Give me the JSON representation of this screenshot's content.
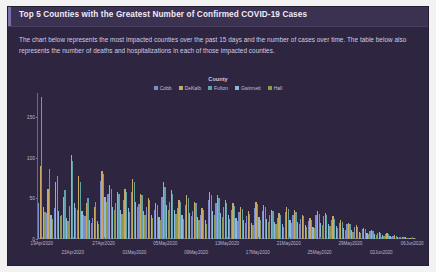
{
  "card": {
    "title": "Top 5 Counties with the Greatest Number of Confirmed COVID-19 Cases",
    "description": "The chart below represents the most impacted counties over the past 15 days and the number of cases over time. The table below also represents the number of deaths and hospitalizations in each of those impacted counties."
  },
  "theme": {
    "card_bg": "#2e2640",
    "titlebar_bg": "#3b3150",
    "title_color": "#efeaf7",
    "text_color": "#d3cbe4",
    "axis_color": "#6f6694",
    "page_bg": "#f2f2f2"
  },
  "chart_data": {
    "type": "bar",
    "title": "",
    "legend_title": "County",
    "legend_position": "top",
    "xlabel": "",
    "ylabel": "",
    "ylim": [
      0,
      180
    ],
    "yticks": [
      0,
      50,
      100,
      150
    ],
    "ytick_labels": [
      "0",
      "50",
      "100",
      "150"
    ],
    "grid": false,
    "colors": [
      "#7b8cd4",
      "#c9a962",
      "#5fa3a8",
      "#8fb8e0",
      "#8a9a4e"
    ],
    "categories": [
      "19Apr2020",
      "20Apr2020",
      "21Apr2020",
      "22Apr2020",
      "23Apr2020",
      "24Apr2020",
      "25Apr2020",
      "26Apr2020",
      "27Apr2020",
      "28Apr2020",
      "29Apr2020",
      "30Apr2020",
      "01May2020",
      "02May2020",
      "03May2020",
      "04May2020",
      "05May2020",
      "06May2020",
      "07May2020",
      "08May2020",
      "09May2020",
      "10May2020",
      "11May2020",
      "12May2020",
      "13May2020",
      "14May2020",
      "15May2020",
      "16May2020",
      "17May2020",
      "18May2020",
      "19May2020",
      "20May2020",
      "21May2020",
      "22May2020",
      "23May2020",
      "24May2020",
      "25May2020",
      "26May2020",
      "27May2020",
      "28May2020",
      "29May2020",
      "30May2020",
      "31May2020",
      "01Jun2020",
      "02Jun2020",
      "03Jun2020",
      "04Jun2020",
      "05Jun2020",
      "06Jun2020"
    ],
    "tick_labels": [
      {
        "category": "19Apr2020",
        "row": 0
      },
      {
        "category": "23Apr2020",
        "row": 1
      },
      {
        "category": "27Apr2020",
        "row": 0
      },
      {
        "category": "01May2020",
        "row": 1
      },
      {
        "category": "05May2020",
        "row": 0
      },
      {
        "category": "09May2020",
        "row": 1
      },
      {
        "category": "13May2020",
        "row": 0
      },
      {
        "category": "17May2020",
        "row": 1
      },
      {
        "category": "21May2020",
        "row": 0
      },
      {
        "category": "25May2020",
        "row": 1
      },
      {
        "category": "29May2020",
        "row": 0
      },
      {
        "category": "02Jun2020",
        "row": 1
      },
      {
        "category": "06Jun2020",
        "row": 0
      }
    ],
    "series": [
      {
        "name": "Cobb",
        "color": "#7b8cd4",
        "values": [
          45,
          32,
          38,
          30,
          41,
          36,
          28,
          26,
          72,
          55,
          44,
          48,
          58,
          43,
          40,
          36,
          52,
          46,
          38,
          42,
          35,
          30,
          48,
          44,
          40,
          36,
          33,
          28,
          38,
          35,
          30,
          26,
          33,
          30,
          25,
          22,
          30,
          28,
          24,
          20,
          18,
          15,
          12,
          10,
          8,
          6,
          4,
          2,
          1
        ]
      },
      {
        "name": "DeKalb",
        "color": "#c9a962",
        "values": [
          90,
          62,
          70,
          52,
          104,
          78,
          44,
          40,
          84,
          66,
          58,
          62,
          74,
          56,
          50,
          44,
          70,
          60,
          48,
          54,
          46,
          38,
          58,
          54,
          48,
          44,
          40,
          34,
          46,
          42,
          36,
          32,
          40,
          36,
          30,
          26,
          34,
          32,
          28,
          24,
          20,
          17,
          14,
          11,
          9,
          7,
          5,
          3,
          1
        ]
      },
      {
        "name": "Fulton",
        "color": "#5fa3a8",
        "values": [
          175,
          86,
          78,
          60,
          96,
          70,
          50,
          46,
          80,
          62,
          56,
          58,
          70,
          54,
          48,
          42,
          64,
          56,
          46,
          50,
          44,
          36,
          54,
          50,
          45,
          41,
          37,
          31,
          43,
          39,
          34,
          30,
          37,
          33,
          28,
          24,
          31,
          29,
          25,
          21,
          18,
          15,
          12,
          10,
          8,
          6,
          4,
          2,
          1
        ]
      },
      {
        "name": "Gwinnett",
        "color": "#8fb8e0",
        "values": [
          40,
          30,
          34,
          26,
          44,
          34,
          24,
          22,
          52,
          40,
          36,
          38,
          46,
          34,
          30,
          27,
          42,
          36,
          29,
          32,
          27,
          23,
          35,
          32,
          29,
          26,
          23,
          20,
          27,
          25,
          21,
          18,
          23,
          21,
          17,
          15,
          20,
          18,
          16,
          13,
          11,
          9,
          7,
          6,
          5,
          4,
          3,
          2,
          1
        ]
      },
      {
        "name": "Hall",
        "color": "#8a9a4e",
        "values": [
          33,
          25,
          28,
          22,
          38,
          29,
          20,
          18,
          46,
          36,
          31,
          33,
          40,
          30,
          26,
          23,
          36,
          31,
          25,
          28,
          23,
          19,
          30,
          27,
          25,
          22,
          20,
          17,
          23,
          21,
          18,
          15,
          20,
          18,
          15,
          13,
          17,
          16,
          13,
          11,
          9,
          8,
          6,
          5,
          4,
          3,
          2,
          1,
          1
        ]
      }
    ]
  }
}
